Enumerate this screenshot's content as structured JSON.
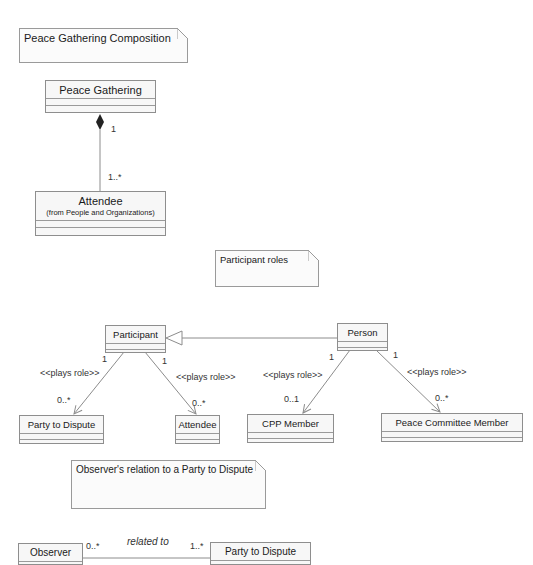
{
  "notes": [
    {
      "id": "note-composition",
      "text": "Peace Gathering Composition"
    },
    {
      "id": "note-participant-roles",
      "text": "Participant roles"
    },
    {
      "id": "note-observer-relation",
      "text": "Observer's relation to a Party to Dispute"
    }
  ],
  "classes": {
    "peace_gathering": {
      "name": "Peace Gathering"
    },
    "attendee_top": {
      "name": "Attendee",
      "from": "(from People and Organizations)"
    },
    "participant": {
      "name": "Participant"
    },
    "person": {
      "name": "Person"
    },
    "party_to_dispute_1": {
      "name": "Party to Dispute"
    },
    "attendee_role": {
      "name": "Attendee"
    },
    "cpp_member": {
      "name": "CPP Member"
    },
    "peace_committee_member": {
      "name": "Peace Committee Member"
    },
    "observer": {
      "name": "Observer"
    },
    "party_to_dispute_2": {
      "name": "Party to Dispute"
    }
  },
  "relations": {
    "composition": {
      "source_mult": "1",
      "target_mult": "1..*"
    },
    "participant_party": {
      "stereotype": "<<plays role>>",
      "source_mult": "1",
      "target_mult": "0..*"
    },
    "participant_attendee": {
      "stereotype": "<<plays role>>",
      "source_mult": "1",
      "target_mult": "0..*"
    },
    "person_cpp": {
      "stereotype": "<<plays role>>",
      "source_mult": "1",
      "target_mult": "0..1"
    },
    "person_pcm": {
      "stereotype": "<<plays role>>",
      "source_mult": "1",
      "target_mult": "0..*"
    },
    "observer_party": {
      "name": "related to",
      "source_mult": "0..*",
      "target_mult": "1..*"
    }
  },
  "colors": {
    "line": "#8c8c8c",
    "box_fill": "#f7f7f7",
    "border": "#8e8e8e"
  }
}
